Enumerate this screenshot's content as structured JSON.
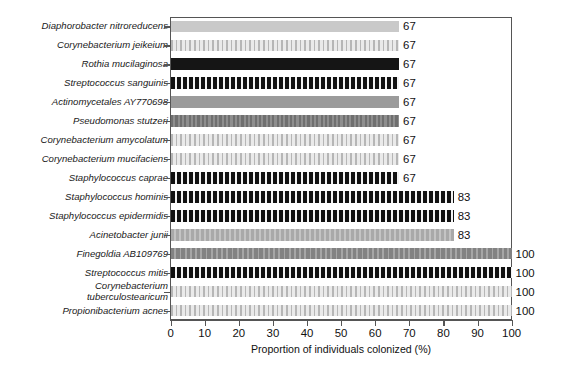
{
  "chart_data": {
    "type": "bar",
    "orientation": "horizontal",
    "title": "",
    "xlabel": "Proportion of individuals colonized (%)",
    "ylabel": "",
    "xlim": [
      0,
      100
    ],
    "xticks": [
      0,
      10,
      20,
      30,
      40,
      50,
      60,
      70,
      80,
      90,
      100
    ],
    "grid": false,
    "legend": "none",
    "value_label_suffix": "",
    "categories": [
      "Diaphorobacter nitroreducens",
      "Corynebacterium jeikeium",
      "Rothia mucilaginosa",
      "Streptococcus sanguinis",
      "Actinomycetales AY770698",
      "Pseudomonas stutzeri",
      "Corynebacterium amycolatum",
      "Corynebacterium mucifaciens",
      "Staphylococcus caprae",
      "Staphylococcus hominis",
      "Staphylococcus epidermidis",
      "Acinetobacter junii",
      "Finegoldia AB109769",
      "Streptococcus mitis",
      "Corynebacterium\ntuberculostearicum",
      "Propionibacterium acnes"
    ],
    "values": [
      67,
      67,
      67,
      67,
      67,
      67,
      67,
      67,
      67,
      83,
      83,
      83,
      100,
      100,
      100,
      100
    ],
    "value_labels": [
      "67",
      "67",
      "67",
      "67",
      "67",
      "67",
      "67",
      "67",
      "67",
      "83",
      "83",
      "83",
      "100",
      "100",
      "100",
      "100"
    ],
    "patterns": [
      "p1",
      "p2",
      "p3",
      "p4",
      "p5",
      "p6",
      "p2",
      "p2",
      "p4",
      "p4",
      "p4",
      "p8",
      "p7",
      "p4",
      "p2",
      "p2"
    ]
  },
  "axis": {
    "x_title": "Proportion of individuals colonized (%)",
    "tick_labels": [
      "0",
      "10",
      "20",
      "30",
      "40",
      "50",
      "60",
      "70",
      "80",
      "90",
      "100"
    ]
  },
  "colors": {
    "frame": "#555555",
    "text": "#111111",
    "light_gray": "#c9c9c9",
    "medium_gray": "#9b9b9b",
    "dark": "#151515",
    "background": "#ffffff"
  }
}
